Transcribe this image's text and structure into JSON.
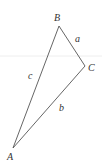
{
  "diagram": {
    "type": "triangle",
    "vertices": [
      {
        "name": "A",
        "x": 13,
        "y": 148,
        "label_x": 7,
        "label_y": 160
      },
      {
        "name": "B",
        "x": 59,
        "y": 26,
        "label_x": 54,
        "label_y": 21
      },
      {
        "name": "C",
        "x": 85,
        "y": 66,
        "label_x": 88,
        "label_y": 71
      }
    ],
    "sides": [
      {
        "name": "a",
        "from": "B",
        "to": "C",
        "label_x": 75,
        "label_y": 42
      },
      {
        "name": "b",
        "from": "C",
        "to": "A",
        "label_x": 59,
        "label_y": 111
      },
      {
        "name": "c",
        "from": "A",
        "to": "B",
        "label_x": 28,
        "label_y": 79
      }
    ],
    "colors": {
      "line": "#555555",
      "text": "#333333",
      "background": "#ffffff",
      "faint_guide": "#eeeeee"
    }
  }
}
